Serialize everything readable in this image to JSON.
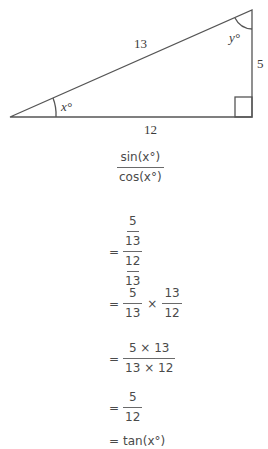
{
  "triangle": {
    "hypotenuse_label": "13",
    "opposite_label": "5",
    "adjacent_label": "12",
    "angle_x_label": "x°",
    "angle_y_label": "y°",
    "right_angle_marker": true
  },
  "derivation": {
    "step0": {
      "numerator": "sin(x°)",
      "denominator": "cos(x°)"
    },
    "step1": {
      "eq": "=",
      "top_num": "5",
      "top_den": "13",
      "bot_num": "12",
      "bot_den": "13"
    },
    "step2": {
      "eq": "=",
      "a_num": "5",
      "a_den": "13",
      "op": "×",
      "b_num": "13",
      "b_den": "12"
    },
    "step3": {
      "eq": "=",
      "numerator": "5 × 13",
      "denominator": "13 × 12"
    },
    "step4": {
      "eq": "=",
      "numerator": "5",
      "denominator": "12"
    },
    "step5": {
      "eq": "=",
      "result": "tan(x°)"
    }
  }
}
